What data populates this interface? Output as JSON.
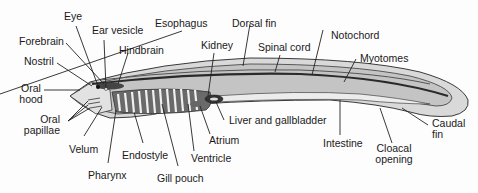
{
  "diagram": {
    "colors": {
      "background": "#fdfdfd",
      "body_fill": "#c8c8c8",
      "body_outline": "#3a3a3a",
      "fin_fill": "#d9d9d9",
      "notochord": "#2a2a2a",
      "gill_dark": "#555555",
      "gill_light": "#f0f0f0",
      "intestine": "#ececec",
      "label_text": "#1a1a1a",
      "leader_line": "#222222"
    },
    "labels": {
      "eye": "Eye",
      "ear_vesicle": "Ear vesicle",
      "forebrain": "Forebrain",
      "hindbrain": "Hindbrain",
      "nostril": "Nostril",
      "oral_hood_1": "Oral",
      "oral_hood_2": "hood",
      "oral_papillae_1": "Oral",
      "oral_papillae_2": "papillae",
      "velum": "Velum",
      "pharynx": "Pharynx",
      "endostyle": "Endostyle",
      "gill_pouch": "Gill pouch",
      "ventricle": "Ventricle",
      "atrium": "Atrium",
      "liver_gallbladder": "Liver and gallbladder",
      "esophagus": "Esophagus",
      "kidney": "Kidney",
      "dorsal_fin": "Dorsal fin",
      "spinal_cord": "Spinal cord",
      "notochord": "Notochord",
      "myotomes": "Myotomes",
      "intestine": "Intestine",
      "cloacal_opening_1": "Cloacal",
      "cloacal_opening_2": "opening",
      "caudal_fin_1": "Caudal",
      "caudal_fin_2": "fin"
    }
  }
}
